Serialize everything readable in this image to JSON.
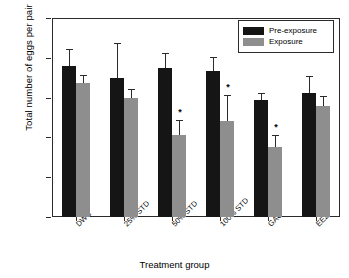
{
  "chart_data": {
    "type": "bar",
    "title": "",
    "xlabel": "Treatment group",
    "ylabel": "Total number of eggs per pair",
    "categories": [
      "DWC",
      "25% STD",
      "50% STD",
      "100% STD",
      "GAC",
      "EE2"
    ],
    "ylim": [
      0,
      2500
    ],
    "yticks": [
      0,
      500,
      1000,
      1500,
      2000,
      2500
    ],
    "ytick_labels": [
      "0",
      "500",
      "1000",
      "1500",
      "2000",
      "2500"
    ],
    "grid": false,
    "legend_position": "top-right",
    "series": [
      {
        "name": "Pre-exposure",
        "color": "#151515",
        "values": [
          1900,
          1750,
          1870,
          1840,
          1470,
          1555
        ],
        "error_upper": [
          210,
          430,
          190,
          170,
          90,
          215
        ],
        "significance": [
          "",
          "",
          "",
          "",
          "",
          ""
        ]
      },
      {
        "name": "Exposure",
        "color": "#8e8e8e",
        "values": [
          1680,
          1490,
          1030,
          1210,
          880,
          1395
        ],
        "error_upper": [
          110,
          115,
          185,
          325,
          155,
          130
        ],
        "significance": [
          "",
          "",
          "*",
          "*",
          "*",
          ""
        ]
      }
    ]
  },
  "legend": {
    "entries": [
      {
        "label": "Pre-exposure",
        "swatch": "pre"
      },
      {
        "label": "Exposure",
        "swatch": "exp"
      }
    ]
  }
}
